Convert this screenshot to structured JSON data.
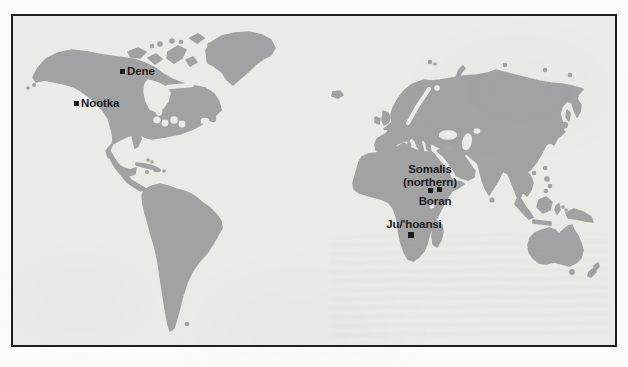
{
  "figure": {
    "type": "world-map",
    "locations": [
      {
        "id": "dene",
        "label": "Dene"
      },
      {
        "id": "nootka",
        "label": "Nootka"
      },
      {
        "id": "somalis",
        "label_line1": "Somalis",
        "label_line2": "(northern)"
      },
      {
        "id": "boran",
        "label": "Boran"
      },
      {
        "id": "juhoansi",
        "label": "Ju/'hoansi"
      }
    ],
    "colors": {
      "land": "#a2a2a2",
      "ocean": "#eaeae7",
      "frame": "#1f1f1f",
      "marker": "#1c1c1c",
      "page": "#fbfbf8",
      "text": "#1b1b1b"
    }
  }
}
